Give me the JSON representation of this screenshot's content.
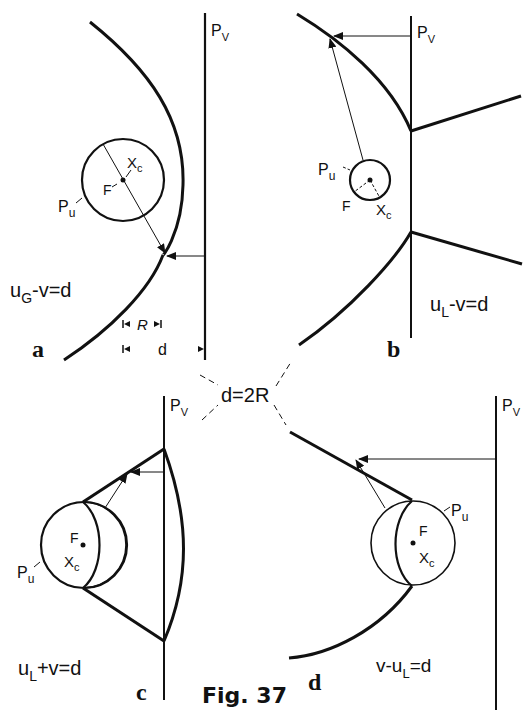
{
  "figure": {
    "title": "Fig. 37",
    "center_label": "d=2R"
  },
  "panels": {
    "a": {
      "letter": "a",
      "plane_label": "P",
      "plane_sub": "V",
      "circle_label": "P",
      "circle_sub": "u",
      "focus_label": "F",
      "center_label": "X",
      "center_sub": "c",
      "equation_main": "u",
      "equation_sub": "G",
      "equation_rest": "-v=d",
      "dim_R": "R",
      "dim_d": "d"
    },
    "b": {
      "letter": "b",
      "plane_label": "P",
      "plane_sub": "V",
      "circle_label": "P",
      "circle_sub": "u",
      "focus_label": "F",
      "center_label": "X",
      "center_sub": "c",
      "equation_main": "u",
      "equation_sub": "L",
      "equation_rest": "-v=d"
    },
    "c": {
      "letter": "c",
      "plane_label": "P",
      "plane_sub": "V",
      "circle_label": "P",
      "circle_sub": "u",
      "focus_label": "F",
      "center_label": "X",
      "center_sub": "c",
      "equation_main": "u",
      "equation_sub": "L",
      "equation_rest": "+v=d"
    },
    "d": {
      "letter": "d",
      "plane_label": "P",
      "plane_sub": "V",
      "circle_label": "P",
      "circle_sub": "u",
      "focus_label": "F",
      "center_label": "X",
      "center_sub": "c",
      "equation_pre": "v-u",
      "equation_sub": "L",
      "equation_rest": "=d"
    }
  }
}
